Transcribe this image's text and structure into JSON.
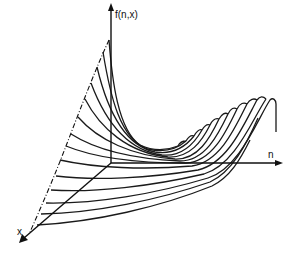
{
  "diagram": {
    "type": "3d-curve-family",
    "colors": {
      "stroke": "#1a1a1a",
      "background": "#ffffff"
    },
    "axes": {
      "vertical": {
        "label": "f(n,x)"
      },
      "horizontal": {
        "label": "n"
      },
      "depth": {
        "label": "x"
      }
    },
    "envelope": {
      "style": "dash-dot",
      "description": "boundary joining left ends of curves"
    },
    "curve_count": 15
  }
}
